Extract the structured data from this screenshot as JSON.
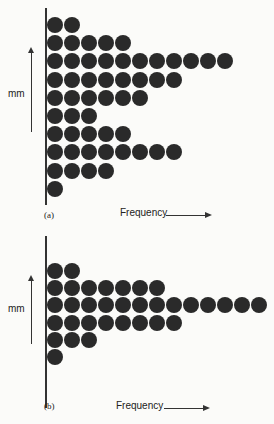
{
  "chart_data": [
    {
      "type": "dot-histogram",
      "panel_label": "(a)",
      "orientation": "horizontal",
      "ylabel": "mm",
      "xlabel": "Frequency",
      "rows_top_to_bottom": [
        2,
        5,
        11,
        8,
        6,
        3,
        5,
        8,
        4,
        1
      ]
    },
    {
      "type": "dot-histogram",
      "panel_label": "(b)",
      "orientation": "horizontal",
      "ylabel": "mm",
      "xlabel": "Frequency",
      "rows_top_to_bottom": [
        2,
        7,
        13,
        8,
        3,
        1
      ]
    }
  ],
  "panels": {
    "a": {
      "label": "(a)",
      "ylabel": "mm",
      "xlabel": "Frequency"
    },
    "b": {
      "label": "(b)",
      "ylabel": "mm",
      "xlabel": "Frequency"
    }
  }
}
